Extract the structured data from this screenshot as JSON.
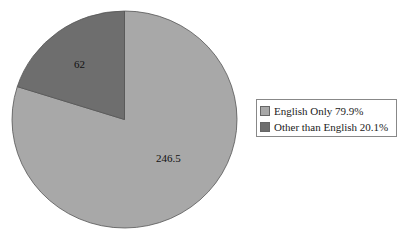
{
  "chart_data": {
    "type": "pie",
    "title": "",
    "categories": [
      "English Only",
      "Other than English"
    ],
    "values": [
      246.5,
      62
    ],
    "percentages": [
      79.9,
      20.1
    ],
    "data_labels": [
      "246.5",
      "62"
    ],
    "colors": [
      "#a8a8a8",
      "#6e6e6e"
    ],
    "legend_position": "right",
    "start_angle": "12 o'clock, clockwise"
  },
  "legend": {
    "items": [
      {
        "label": "English Only 79.9%",
        "color": "#a8a8a8"
      },
      {
        "label": "Other than English 20.1%",
        "color": "#6e6e6e"
      }
    ]
  },
  "labels": {
    "english": "246.5",
    "other": "62"
  }
}
